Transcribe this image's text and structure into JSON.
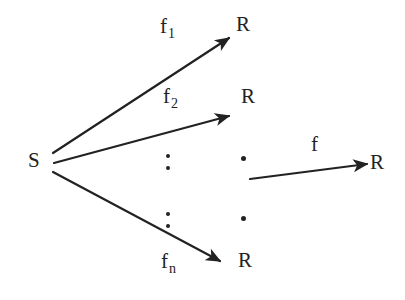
{
  "diagram": {
    "background_color": "#ffffff",
    "ink_color": "#222222",
    "source": {
      "label": "S",
      "x": 28,
      "y": 150
    },
    "arrows": [
      {
        "name": "arrow-f1",
        "label": "f",
        "subscript": "1",
        "label_x": 160,
        "label_y": 16,
        "x1": 53,
        "y1": 153,
        "x2": 229,
        "y2": 38
      },
      {
        "name": "arrow-f2",
        "label": "f",
        "subscript": "2",
        "label_x": 163,
        "label_y": 86,
        "x1": 54,
        "y1": 163,
        "x2": 229,
        "y2": 116
      },
      {
        "name": "arrow-fn",
        "label": "f",
        "subscript": "n",
        "label_x": 161,
        "label_y": 251,
        "x1": 53,
        "y1": 172,
        "x2": 220,
        "y2": 261
      },
      {
        "name": "arrow-f",
        "label": "f",
        "subscript": "",
        "label_x": 311,
        "label_y": 134,
        "x1": 250,
        "y1": 179,
        "x2": 367,
        "y2": 164
      }
    ],
    "targets": [
      {
        "name": "target-r1",
        "label": "R",
        "x": 236,
        "y": 14
      },
      {
        "name": "target-r2",
        "label": "R",
        "x": 241,
        "y": 86
      },
      {
        "name": "target-rn",
        "label": "R",
        "x": 238,
        "y": 250
      },
      {
        "name": "target-r-final",
        "label": "R",
        "x": 370,
        "y": 152
      }
    ],
    "ellipses_vertical": [
      {
        "name": "vdots-upper",
        "x": 166,
        "y": 154
      },
      {
        "name": "vdots-lower",
        "x": 166,
        "y": 212
      }
    ],
    "ellipses_dots": [
      {
        "name": "dot-upper",
        "x": 241,
        "y": 156
      },
      {
        "name": "dot-lower",
        "x": 241,
        "y": 216
      }
    ]
  }
}
